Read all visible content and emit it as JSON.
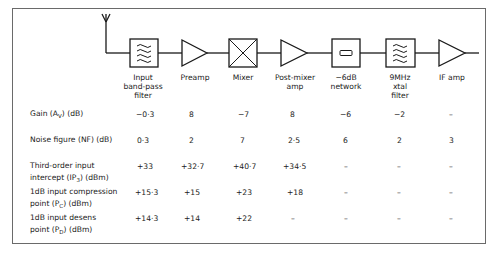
{
  "diagram": {
    "type": "receiver front-end block diagram with performance table",
    "stages": [
      {
        "id": "input-bpf",
        "label": "Input\nband-pass\nfilter",
        "symbol": "filter-box",
        "x": 143
      },
      {
        "id": "preamp",
        "label": "Preamp",
        "symbol": "amplifier-triangle",
        "x": 195
      },
      {
        "id": "mixer",
        "label": "Mixer",
        "symbol": "mixer-box",
        "x": 243
      },
      {
        "id": "post-mixer-amp",
        "label": "Post-mixer\namp",
        "symbol": "amplifier-triangle",
        "x": 295
      },
      {
        "id": "6db-network",
        "label": "−6dB\nnetwork",
        "symbol": "attenuator-box",
        "x": 346
      },
      {
        "id": "xtal-filter",
        "label": "9MHz\nxtal\nfilter",
        "symbol": "filter-box",
        "x": 400
      },
      {
        "id": "if-amp",
        "label": "IF amp",
        "symbol": "amplifier-triangle",
        "x": 452
      }
    ],
    "antenna": "antenna-symbol"
  },
  "table": {
    "rows": [
      {
        "label_parts": [
          "Gain (A",
          "V",
          ") (dB)"
        ],
        "lines": 1,
        "values": [
          "−0·3",
          "8",
          "−7",
          "8",
          "−6",
          "−2",
          "–"
        ]
      },
      {
        "label_parts": [
          "Noise figure (NF) (dB)"
        ],
        "lines": 1,
        "values": [
          "0·3",
          "2",
          "7",
          "2·5",
          "6",
          "2",
          "3"
        ]
      },
      {
        "label_parts": [
          "Third-order input\nintercept (IP",
          "3",
          ") (dBm)"
        ],
        "lines": 2,
        "values": [
          "+33",
          "+32·7",
          "+40·7",
          "+34·5",
          "–",
          "–",
          "–"
        ]
      },
      {
        "label_parts": [
          "1dB input compression\npoint (P",
          "C",
          ") (dBm)"
        ],
        "lines": 2,
        "values": [
          "+15·3",
          "+15",
          "+23",
          "+18",
          "–",
          "–",
          "–"
        ]
      },
      {
        "label_parts": [
          "1dB input desens\npoint (P",
          "D",
          ") (dBm)"
        ],
        "lines": 2,
        "values": [
          "+14·3",
          "+14",
          "+22",
          "–",
          "–",
          "–",
          "–"
        ]
      }
    ]
  },
  "labels": {
    "row0": {
      "a": "Gain (A",
      "sub": "V",
      "b": ") (dB)"
    },
    "row1": {
      "a": "Noise figure (NF) (dB)"
    },
    "row2": {
      "l1": "Third-order input",
      "a": "intercept (IP",
      "sub": "3",
      "b": ") (dBm)"
    },
    "row3": {
      "l1": "1dB input compression",
      "a": "point (P",
      "sub": "C",
      "b": ") (dBm)"
    },
    "row4": {
      "l1": "1dB input desens",
      "a": "point (P",
      "sub": "D",
      "b": ") (dBm)"
    }
  },
  "headers": {
    "h0": "Input\nband-pass\nfilter",
    "h1": "Preamp",
    "h2": "Mixer",
    "h3": "Post-mixer\namp",
    "h4": "−6dB\nnetwork",
    "h5": "9MHz\nxtal\nfilter",
    "h6": "IF amp"
  },
  "cells": {
    "r0": [
      "−0·3",
      "8",
      "−7",
      "8",
      "−6",
      "−2",
      "–"
    ],
    "r1": [
      "0·3",
      "2",
      "7",
      "2·5",
      "6",
      "2",
      "3"
    ],
    "r2": [
      "+33",
      "+32·7",
      "+40·7",
      "+34·5",
      "–",
      "–",
      "–"
    ],
    "r3": [
      "+15·3",
      "+15",
      "+23",
      "+18",
      "–",
      "–",
      "–"
    ],
    "r4": [
      "+14·3",
      "+14",
      "+22",
      "–",
      "–",
      "–",
      "–"
    ]
  },
  "colors": {
    "line": "#1a1a1a",
    "frame": "#6a6a6a",
    "text": "#222222",
    "background": "#ffffff"
  }
}
